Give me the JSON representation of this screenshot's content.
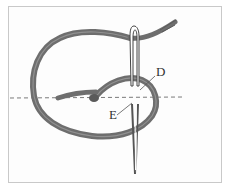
{
  "figure": {
    "labels": [
      {
        "id": "D",
        "text": "D"
      },
      {
        "id": "E",
        "text": "E"
      }
    ],
    "colors": {
      "thread": "#6e6e6e",
      "thread_dark": "#4a4a4a",
      "needle": "#555555",
      "guide_line": "#7a7a7a",
      "border": "#c9c9c9",
      "background": "#ffffff"
    }
  }
}
